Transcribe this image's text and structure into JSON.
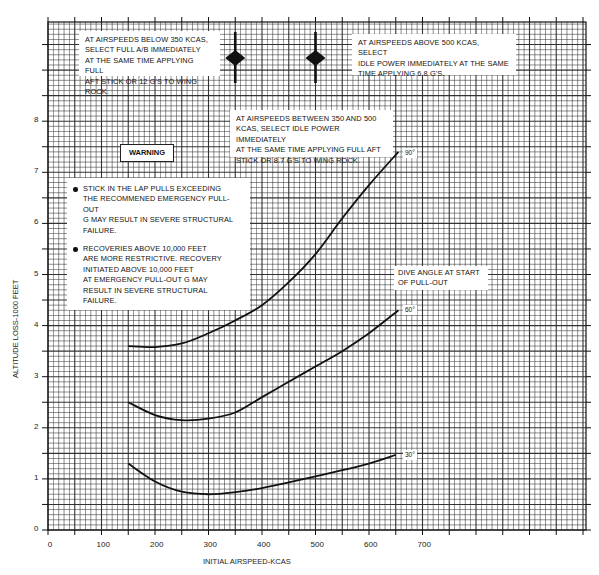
{
  "chart_data": {
    "type": "line",
    "title": "",
    "xlabel": "INITIAL AIRSPEED-KCAS",
    "ylabel": "ALTITUDE LOSS-1000 FEET",
    "xlim": [
      0,
      1000
    ],
    "ylim": [
      0,
      9.9
    ],
    "x_ticks": [
      0,
      100,
      200,
      300,
      400,
      500,
      600,
      700
    ],
    "y_ticks": [
      0,
      1,
      2,
      3,
      4,
      5,
      6,
      7,
      8
    ],
    "grid": true,
    "legend_title": "DIVE ANGLE AT START OF PULL-OUT",
    "series": [
      {
        "name": "90°",
        "x": [
          150,
          200,
          250,
          300,
          350,
          400,
          450,
          500,
          550,
          600,
          655
        ],
        "y": [
          3.6,
          3.58,
          3.65,
          3.85,
          4.1,
          4.4,
          4.85,
          5.4,
          6.1,
          6.75,
          7.4
        ]
      },
      {
        "name": "60°",
        "x": [
          150,
          200,
          250,
          300,
          350,
          400,
          450,
          500,
          550,
          600,
          655
        ],
        "y": [
          2.5,
          2.25,
          2.15,
          2.18,
          2.3,
          2.6,
          2.9,
          3.2,
          3.5,
          3.85,
          4.3
        ]
      },
      {
        "name": "30°",
        "x": [
          150,
          200,
          250,
          300,
          350,
          400,
          450,
          500,
          550,
          600,
          650
        ],
        "y": [
          1.3,
          0.95,
          0.75,
          0.7,
          0.74,
          0.82,
          0.93,
          1.05,
          1.17,
          1.3,
          1.47
        ]
      }
    ],
    "annotations": [
      {
        "text": "AT AIRSPEEDS BELOW 350 KCAS, SELECT FULL A/B IMMEDIATELY AT THE SAME TIME APPLYING FULL AFT STICK OR 12 g's TO WING ROCK."
      },
      {
        "text": "AT AIRSPEEDS ABOVE 500 KCAS, SELECT IDLE POWER IMMEDIATELY AT THE SAME TIME APPLYING 6.8 g's."
      },
      {
        "text": "AT AIRSPEEDS BETWEEN 350 AND 500 KCAS, SELECT IDLE POWER IMMEDIATELY AT THE SAME TIME APPLYING FULL AFT STICK OR 8.7 g's TO WING ROCK."
      },
      {
        "text": "WARNING"
      },
      {
        "text": "STICK IN THE LAP PULLS EXCEEDING THE RECOMMENED EMERGENCY PULL-OUT G MAY RESULT IN SEVERE STRUCTURAL FAILURE."
      },
      {
        "text": "RECOVERIES ABOVE 10,000 FEET ARE MORE RESTRICTIVE. RECOVERY INITIATED ABOVE 10,000 FEET AT EMERGENCY PULL-OUT G MAY RESULT IN SEVERE STRUCTURAL FAILURE."
      },
      {
        "text": "Markers at 350 KCAS and 500 KCAS",
        "x": [
          350,
          500
        ]
      }
    ]
  },
  "notes": {
    "below_350": [
      "AT AIRSPEEDS BELOW 350 KCAS,",
      "SELECT FULL A/B IMMEDIATELY",
      "AT THE SAME TIME APPLYING FULL",
      "AFT STICK OR 12 g's TO WING ROCK."
    ],
    "above_500": [
      "AT AIRSPEEDS ABOVE 500 KCAS, SELECT",
      "IDLE POWER IMMEDIATELY AT THE SAME",
      "TIME APPLYING 6.8 g's."
    ],
    "between": [
      "AT AIRSPEEDS BETWEEN 350 AND 500",
      "KCAS, SELECT IDLE POWER IMMEDIATELY",
      "AT THE SAME TIME APPLYING FULL AFT",
      "STICK OR 8.7 g's TO WING ROCK."
    ],
    "warning_title": "WARNING",
    "warning_1": [
      "STICK IN THE LAP PULLS EXCEEDING",
      "THE RECOMMENED EMERGENCY PULL-OUT",
      "G MAY RESULT IN SEVERE STRUCTURAL",
      "FAILURE."
    ],
    "warning_2": [
      "RECOVERIES ABOVE 10,000 FEET",
      "ARE MORE RESTRICTIVE. RECOVERY",
      "INITIATED ABOVE 10,000 FEET",
      "AT EMERGENCY PULL-OUT G MAY",
      "RESULT IN SEVERE STRUCTURAL",
      "FAILURE."
    ],
    "dive_angle": [
      "DIVE ANGLE AT START",
      "OF PULL-OUT"
    ]
  },
  "curve_labels": {
    "c90": "90°",
    "c60": "60°",
    "c30": "30°"
  },
  "axes": {
    "x_title": "INITIAL AIRSPEED-KCAS",
    "y_title": "ALTITUDE LOSS-1000 FEET",
    "x_tick_labels": [
      "0",
      "100",
      "200",
      "300",
      "400",
      "500",
      "600",
      "700"
    ],
    "y_tick_labels": [
      "0",
      "1",
      "2",
      "3",
      "4",
      "5",
      "6",
      "7",
      "8"
    ]
  },
  "style": {
    "line_color": "#111111",
    "grid_color": "#2a2a2a",
    "background": "#ffffff"
  }
}
